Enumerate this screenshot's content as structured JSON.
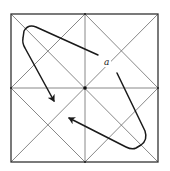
{
  "diagram": {
    "type": "square-grid-with-diagonals",
    "frame": {
      "x1": 11,
      "y1": 14,
      "x2": 158,
      "y2": 162
    },
    "center": {
      "x": 85,
      "y": 88
    },
    "label": {
      "text": "a",
      "x": 106,
      "y": 65
    },
    "colors": {
      "grid_line": "#6a6a6a",
      "frame_line": "#333333",
      "arrow": "#1a1a1a",
      "background": "#ffffff"
    },
    "arrows": [
      {
        "name": "upper-left-arrow",
        "path": "M 98 55 L 36 27 Q 28 24 24 31 L 23 38 Q 22 43 25 48 L 54 101",
        "tip": {
          "x": 54,
          "y": 102
        }
      },
      {
        "name": "lower-right-arrow",
        "path": "M 117 73 L 145 131 Q 148 140 141 145 L 136 148 Q 132 150 126 147 L 69 118",
        "tip": {
          "x": 69,
          "y": 117
        }
      }
    ]
  }
}
